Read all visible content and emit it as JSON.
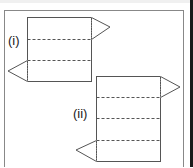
{
  "diagram": {
    "frame": {
      "x": 4,
      "y": 10,
      "width": 179,
      "height": 160,
      "stroke": "#888888"
    },
    "line_color": "#555555",
    "label_color": "#222222",
    "nets": [
      {
        "label": "(i)",
        "label_pos": {
          "x": 8,
          "y": 45
        },
        "rect": {
          "x": 27,
          "y": 17,
          "width": 64,
          "height": 64
        },
        "fold_lines_y": [
          39,
          60
        ],
        "right_triangle": {
          "base_top": 17,
          "base_bottom": 39,
          "tip": {
            "x": 110,
            "y": 27
          }
        },
        "left_triangle": {
          "base_top": 60,
          "base_bottom": 81,
          "tip": {
            "x": 8,
            "y": 71
          }
        }
      },
      {
        "label": "(ii)",
        "label_pos": {
          "x": 73,
          "y": 118
        },
        "rect": {
          "x": 96,
          "y": 76,
          "width": 64,
          "height": 85
        },
        "fold_lines_y": [
          97,
          118,
          140
        ],
        "right_triangle": {
          "base_top": 76,
          "base_bottom": 97,
          "tip": {
            "x": 180,
            "y": 87
          }
        },
        "left_triangle": {
          "base_top": 140,
          "base_bottom": 161,
          "tip": {
            "x": 76,
            "y": 150
          }
        }
      }
    ]
  }
}
